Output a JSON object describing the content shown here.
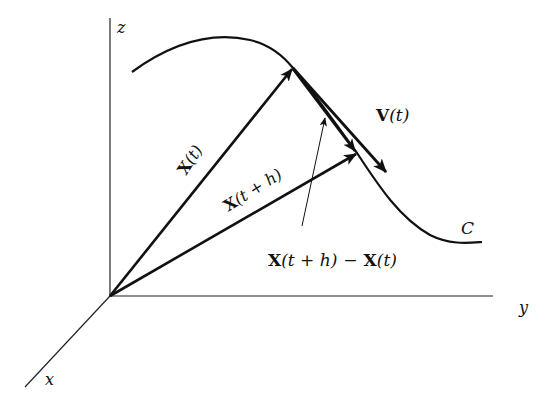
{
  "diagram": {
    "type": "vector-calculus-curve",
    "axes": {
      "x_label": "x",
      "y_label": "y",
      "z_label": "z"
    },
    "curve_label": "C",
    "vectors": {
      "position_t": {
        "label_bold": "X",
        "label_rest": "(t)"
      },
      "position_t_plus_h": {
        "label_bold": "X",
        "label_rest": "(t + h)"
      },
      "velocity": {
        "label_bold": "V",
        "label_rest": "(t)"
      },
      "difference": {
        "part1_bold": "X",
        "part1_rest": "(t + h)",
        "minus": "−",
        "part2_bold": "X",
        "part2_rest": "(t)"
      }
    },
    "colors": {
      "ink": "#111111",
      "background": "#ffffff"
    }
  }
}
